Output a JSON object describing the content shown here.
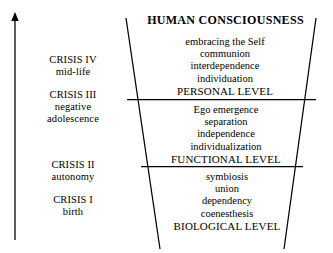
{
  "diagram": {
    "title": "HUMAN CONSCIOUSNESS",
    "axis": {
      "icon": "up-arrow-icon",
      "direction": "up"
    },
    "crises": [
      {
        "id": "crisis-4",
        "label": "CRISIS IV",
        "sublabel": "mid-life"
      },
      {
        "id": "crisis-3",
        "label": "CRISIS III",
        "sublabel": "negative",
        "sublabel2": "adolescence"
      },
      {
        "id": "crisis-2",
        "label": "CRISIS II",
        "sublabel": "autonomy"
      },
      {
        "id": "crisis-1",
        "label": "CRISIS I",
        "sublabel": "birth"
      }
    ],
    "levels": [
      {
        "id": "personal",
        "name": "PERSONAL LEVEL",
        "items": [
          "embracing the Self",
          "communion",
          "interdependence",
          "individuation"
        ]
      },
      {
        "id": "functional",
        "name": "FUNCTIONAL LEVEL",
        "items": [
          "Ego emergence",
          "separation",
          "independence",
          "individualization"
        ]
      },
      {
        "id": "biological",
        "name": "BIOLOGICAL LEVEL",
        "items": [
          "symbiosis",
          "union",
          "dependency",
          "coenesthesis"
        ]
      }
    ],
    "colors": {
      "ink": "#000000",
      "background": "#ffffff"
    }
  }
}
